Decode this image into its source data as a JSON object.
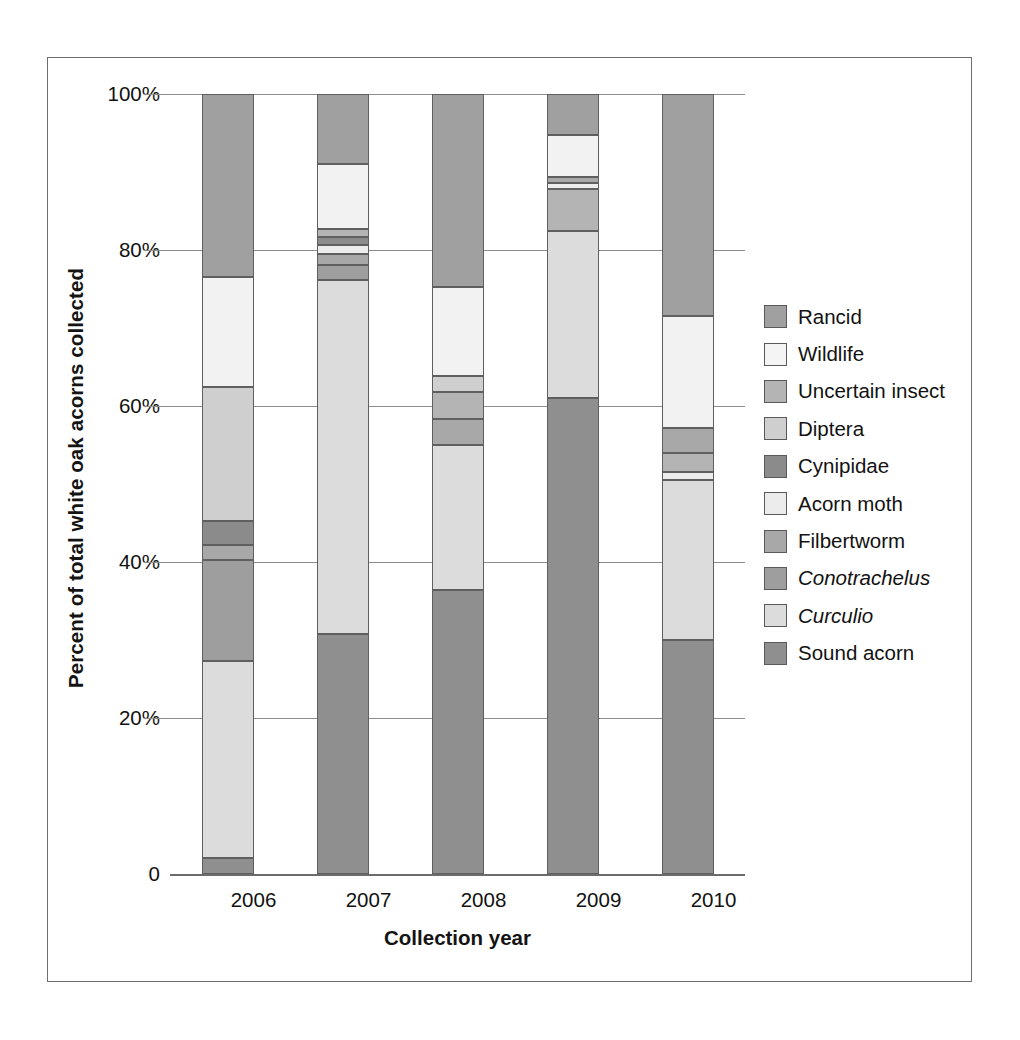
{
  "chart_data": {
    "type": "bar",
    "subtype": "stacked-percentage",
    "title": "",
    "xlabel": "Collection year",
    "ylabel": "Percent of total white oak acorns collected",
    "categories": [
      "2006",
      "2007",
      "2008",
      "2009",
      "2010"
    ],
    "ylim": [
      0,
      100
    ],
    "yticks": [
      "0",
      "20%",
      "40%",
      "60%",
      "80%",
      "100%"
    ],
    "ytick_values": [
      0,
      20,
      40,
      60,
      80,
      100
    ],
    "grid": "horizontal",
    "legend_position": "right",
    "stack_order_bottom_to_top": [
      "Sound acorn",
      "Curculio",
      "Conotrachelus",
      "Filbertworm",
      "Acorn moth",
      "Cynipidae",
      "Diptera",
      "Uncertain insect",
      "Wildlife",
      "Rancid"
    ],
    "series": [
      {
        "name": "Sound acorn",
        "italic": false,
        "color": "#8f8f8f",
        "values": [
          2.0,
          30.8,
          36.4,
          61.0,
          30.0
        ]
      },
      {
        "name": "Curculio",
        "italic": true,
        "color": "#dcdcdc",
        "values": [
          25.3,
          45.3,
          0.0,
          21.5,
          20.5
        ]
      },
      {
        "name": "Conotrachelus",
        "italic": true,
        "color": "#9e9e9e",
        "values": [
          13.0,
          2.0,
          0.0,
          0.0,
          0.0
        ]
      },
      {
        "name": "Filbertworm",
        "italic": false,
        "color": "#a8a8a8",
        "values": [
          1.9,
          1.4,
          3.3,
          0.0,
          3.2
        ]
      },
      {
        "name": "Acorn moth",
        "italic": false,
        "color": "#ececec",
        "values": [
          0.0,
          1.2,
          0.0,
          0.8,
          1.0
        ]
      },
      {
        "name": "Cynipidae",
        "italic": false,
        "color": "#8b8b8b",
        "values": [
          3.0,
          1.0,
          0.0,
          0.0,
          0.0
        ]
      },
      {
        "name": "Diptera",
        "italic": false,
        "color": "#cfcfcf",
        "values": [
          17.3,
          0.0,
          5.5,
          0.0,
          0.0
        ]
      },
      {
        "name": "Uncertain insect",
        "italic": false,
        "color": "#b4b4b4",
        "values": [
          0.0,
          1.0,
          3.5,
          5.3,
          2.5
        ]
      },
      {
        "name": "Wildlife",
        "italic": false,
        "color": "#f2f2f2",
        "values": [
          14.0,
          8.3,
          11.5,
          5.4,
          14.3
        ]
      },
      {
        "name": "Rancid",
        "italic": false,
        "color": "#a0a0a0",
        "values": [
          23.5,
          9.0,
          39.8,
          6.0,
          28.5
        ]
      }
    ],
    "bars": [
      {
        "year": "2006",
        "segments": [
          {
            "name": "Sound acorn",
            "start": 0.0,
            "end": 2.0
          },
          {
            "name": "Curculio",
            "start": 2.0,
            "end": 27.3
          },
          {
            "name": "Conotrachelus",
            "start": 27.3,
            "end": 40.3
          },
          {
            "name": "Filbertworm",
            "start": 40.3,
            "end": 42.2
          },
          {
            "name": "Cynipidae",
            "start": 42.2,
            "end": 45.2
          },
          {
            "name": "Diptera",
            "start": 45.2,
            "end": 62.5
          },
          {
            "name": "Wildlife",
            "start": 62.5,
            "end": 76.5
          },
          {
            "name": "Rancid",
            "start": 76.5,
            "end": 100.0
          }
        ]
      },
      {
        "year": "2007",
        "segments": [
          {
            "name": "Sound acorn",
            "start": 0.0,
            "end": 30.8
          },
          {
            "name": "Curculio",
            "start": 30.8,
            "end": 76.1
          },
          {
            "name": "Conotrachelus",
            "start": 76.1,
            "end": 78.1
          },
          {
            "name": "Filbertworm",
            "start": 78.1,
            "end": 79.5
          },
          {
            "name": "Acorn moth",
            "start": 79.5,
            "end": 80.7
          },
          {
            "name": "Cynipidae",
            "start": 80.7,
            "end": 81.7
          },
          {
            "name": "Uncertain insect",
            "start": 81.7,
            "end": 82.7
          },
          {
            "name": "Wildlife",
            "start": 82.7,
            "end": 91.0
          },
          {
            "name": "Rancid",
            "start": 91.0,
            "end": 100.0
          }
        ]
      },
      {
        "year": "2008",
        "segments": [
          {
            "name": "Sound acorn",
            "start": 0.0,
            "end": 36.4
          },
          {
            "name": "Curculio",
            "start": 36.4,
            "end": 55.0
          },
          {
            "name": "Filbertworm",
            "start": 55.0,
            "end": 58.3
          },
          {
            "name": "Uncertain insect",
            "start": 58.3,
            "end": 61.8
          },
          {
            "name": "Diptera",
            "start": 61.8,
            "end": 63.8
          },
          {
            "name": "Wildlife",
            "start": 63.8,
            "end": 75.3
          },
          {
            "name": "Rancid",
            "start": 75.3,
            "end": 100.0
          }
        ]
      },
      {
        "year": "2009",
        "segments": [
          {
            "name": "Sound acorn",
            "start": 0.0,
            "end": 61.0
          },
          {
            "name": "Curculio",
            "start": 61.0,
            "end": 82.5
          },
          {
            "name": "Uncertain insect",
            "start": 82.5,
            "end": 87.8
          },
          {
            "name": "Acorn moth",
            "start": 87.8,
            "end": 88.6
          },
          {
            "name": "Filbertworm",
            "start": 88.6,
            "end": 89.4
          },
          {
            "name": "Wildlife",
            "start": 89.4,
            "end": 94.8
          },
          {
            "name": "Rancid",
            "start": 94.8,
            "end": 100.0
          }
        ]
      },
      {
        "year": "2010",
        "segments": [
          {
            "name": "Sound acorn",
            "start": 0.0,
            "end": 30.0
          },
          {
            "name": "Curculio",
            "start": 30.0,
            "end": 50.5
          },
          {
            "name": "Acorn moth",
            "start": 50.5,
            "end": 51.5
          },
          {
            "name": "Uncertain insect",
            "start": 51.5,
            "end": 54.0
          },
          {
            "name": "Filbertworm",
            "start": 54.0,
            "end": 57.2
          },
          {
            "name": "Wildlife",
            "start": 57.2,
            "end": 71.5
          },
          {
            "name": "Rancid",
            "start": 71.5,
            "end": 100.0
          }
        ]
      }
    ]
  },
  "legend": {
    "items": [
      {
        "label": "Rancid",
        "color": "#a0a0a0",
        "italic": false
      },
      {
        "label": "Wildlife",
        "color": "#f4f4f4",
        "italic": false
      },
      {
        "label": "Uncertain insect",
        "color": "#b4b4b4",
        "italic": false
      },
      {
        "label": "Diptera",
        "color": "#cfcfcf",
        "italic": false
      },
      {
        "label": "Cynipidae",
        "color": "#8b8b8b",
        "italic": false
      },
      {
        "label": "Acorn moth",
        "color": "#ececec",
        "italic": false
      },
      {
        "label": "Filbertworm",
        "color": "#a8a8a8",
        "italic": false
      },
      {
        "label": "Conotrachelus",
        "color": "#9e9e9e",
        "italic": true
      },
      {
        "label": "Curculio",
        "color": "#dcdcdc",
        "italic": true
      },
      {
        "label": "Sound acorn",
        "color": "#8f8f8f",
        "italic": false
      }
    ]
  }
}
